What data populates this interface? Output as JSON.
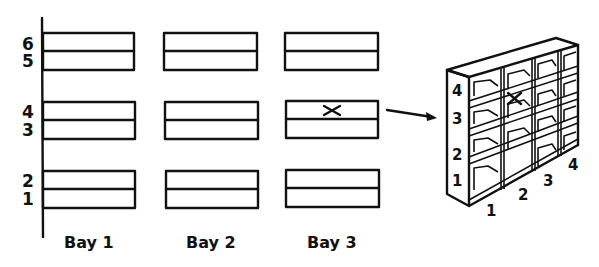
{
  "diagram": {
    "levels": [
      "1",
      "2",
      "3",
      "4",
      "5",
      "6"
    ],
    "bays": [
      {
        "label": "Bay 1"
      },
      {
        "label": "Bay 2"
      },
      {
        "label": "Bay 3"
      }
    ],
    "marker": {
      "symbol": "×",
      "bay": "Bay 3",
      "level": "4"
    },
    "cabinet": {
      "row_labels": [
        "1",
        "2",
        "3",
        "4"
      ],
      "column_labels": [
        "1",
        "2",
        "3",
        "4"
      ],
      "marker": {
        "symbol": "×",
        "row": "4",
        "column": "2"
      }
    },
    "colors": {
      "ink": "#111111",
      "background": "#ffffff"
    }
  }
}
